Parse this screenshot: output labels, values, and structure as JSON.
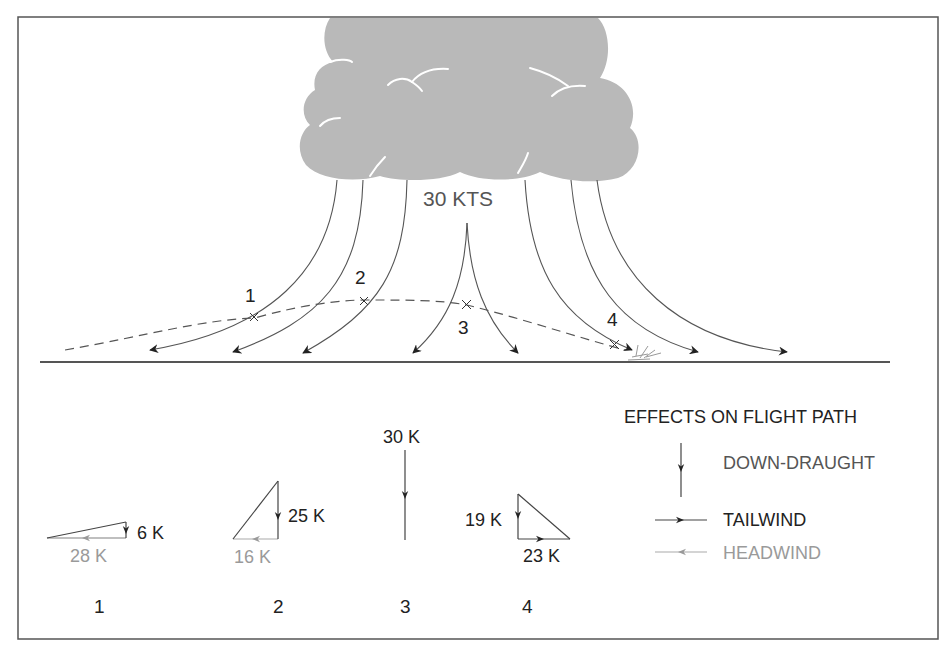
{
  "figure": {
    "cloud_label": "30 KTS",
    "point_labels": [
      "1",
      "2",
      "3",
      "4"
    ],
    "colors": {
      "border": "#555555",
      "cloud": "#b9b9b9",
      "line": "#555555",
      "dark_text": "#222222",
      "headwind": "#9a9a9a",
      "tailwind": "#333333"
    }
  },
  "vector_diagrams": [
    {
      "id": "1",
      "downdraught": "6 K",
      "headwind": "28 K",
      "tailwind": null
    },
    {
      "id": "2",
      "downdraught": "25 K",
      "headwind": "16 K",
      "tailwind": null
    },
    {
      "id": "3",
      "downdraught": "30 K",
      "headwind": null,
      "tailwind": null
    },
    {
      "id": "4",
      "downdraught": "19 K",
      "headwind": null,
      "tailwind": "23 K"
    }
  ],
  "legend": {
    "title": "EFFECTS ON FLIGHT PATH",
    "items": [
      {
        "label": "DOWN-DRAUGHT",
        "icon": "down-arrow-icon"
      },
      {
        "label": "TAILWIND",
        "icon": "right-arrow-icon"
      },
      {
        "label": "HEADWIND",
        "icon": "left-arrow-icon"
      }
    ]
  }
}
